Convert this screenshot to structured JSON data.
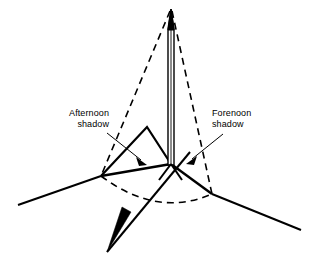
{
  "figure": {
    "type": "technical-line-diagram",
    "background_color": "#ffffff",
    "line_color": "#000000"
  },
  "labels": {
    "afternoon": {
      "line1": "Afternoon",
      "line2": "shadow"
    },
    "forenoon": {
      "line1": "Forenoon",
      "line2": "shadow"
    }
  },
  "geometry": {
    "pole": {
      "apex_x": 171,
      "apex_y": 9,
      "base_x": 171,
      "base_y": 164,
      "width": 4
    },
    "shadow_afternoon_tip": {
      "x": 101,
      "y": 176
    },
    "shadow_forenoon_tip": {
      "x": 212,
      "y": 194
    },
    "ridge_peak": {
      "x": 147,
      "y": 127
    },
    "arc_bottom": {
      "x": 156,
      "y": 203
    },
    "ground_left_end": {
      "x": 18,
      "y": 205
    },
    "ground_right_end": {
      "x": 301,
      "y": 230
    },
    "direction_arrow_tip": {
      "x": 107,
      "y": 252
    }
  },
  "annotations": {
    "leader_afternoon": {
      "from_x": 107,
      "from_y": 133,
      "to_x": 146,
      "to_y": 164
    },
    "leader_forenoon": {
      "from_x": 223,
      "from_y": 134,
      "to_x": 187,
      "to_y": 163
    }
  }
}
